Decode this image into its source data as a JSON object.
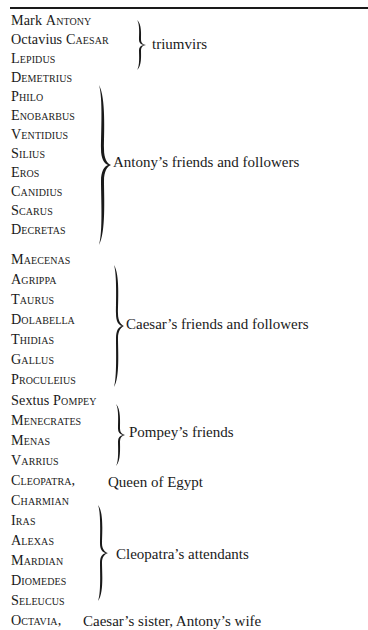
{
  "characters": [
    {
      "prefix": "Mark ",
      "name": "Antony",
      "suffix": ""
    },
    {
      "prefix": "Octavius ",
      "name": "Caesar",
      "suffix": ""
    },
    {
      "prefix": "",
      "name": "Lepidus",
      "suffix": ""
    },
    {
      "prefix": "",
      "name": "Demetrius",
      "suffix": ""
    },
    {
      "prefix": "",
      "name": "Philo",
      "suffix": ""
    },
    {
      "prefix": "",
      "name": "Enobarbus",
      "suffix": ""
    },
    {
      "prefix": "",
      "name": "Ventidius",
      "suffix": ""
    },
    {
      "prefix": "",
      "name": "Silius",
      "suffix": ""
    },
    {
      "prefix": "",
      "name": "Eros",
      "suffix": ""
    },
    {
      "prefix": "",
      "name": "Canidius",
      "suffix": ""
    },
    {
      "prefix": "",
      "name": "Scarus",
      "suffix": ""
    },
    {
      "prefix": "",
      "name": "Decretas",
      "suffix": ""
    },
    {
      "prefix": "",
      "name": "Maecenas",
      "suffix": ""
    },
    {
      "prefix": "",
      "name": "Agrippa",
      "suffix": ""
    },
    {
      "prefix": "",
      "name": "Taurus",
      "suffix": ""
    },
    {
      "prefix": "",
      "name": "Dolabella",
      "suffix": ""
    },
    {
      "prefix": "",
      "name": "Thidias",
      "suffix": ""
    },
    {
      "prefix": "",
      "name": "Gallus",
      "suffix": ""
    },
    {
      "prefix": "",
      "name": "Proculeius",
      "suffix": ""
    },
    {
      "prefix": "Sextus ",
      "name": "Pompey",
      "suffix": ""
    },
    {
      "prefix": "",
      "name": "Menecrates",
      "suffix": ""
    },
    {
      "prefix": "",
      "name": "Menas",
      "suffix": ""
    },
    {
      "prefix": "",
      "name": "Varrius",
      "suffix": ""
    },
    {
      "prefix": "",
      "name": "Cleopatra",
      "suffix": ","
    },
    {
      "prefix": "",
      "name": "Charmian",
      "suffix": ""
    },
    {
      "prefix": "",
      "name": "Iras",
      "suffix": ""
    },
    {
      "prefix": "",
      "name": "Alexas",
      "suffix": ""
    },
    {
      "prefix": "",
      "name": "Mardian",
      "suffix": ""
    },
    {
      "prefix": "",
      "name": "Diomedes",
      "suffix": ""
    },
    {
      "prefix": "",
      "name": "Seleucus",
      "suffix": ""
    },
    {
      "prefix": "",
      "name": "Octavia",
      "suffix": ","
    }
  ],
  "groups": [
    {
      "label": "triumvirs",
      "first_row": 0,
      "last_row": 2
    },
    {
      "label": "Antony’s friends and followers",
      "first_row": 3,
      "last_row": 11
    },
    {
      "label": "Caesar’s friends and followers",
      "first_row": 12,
      "last_row": 18
    },
    {
      "label": "Pompey’s friends",
      "first_row": 19,
      "last_row": 22
    },
    {
      "label": "Cleopatra’s attendants",
      "first_row": 24,
      "last_row": 29
    }
  ],
  "descriptions": [
    {
      "row": 23,
      "text": "Queen of Egypt"
    },
    {
      "row": 30,
      "text": "Caesar’s sister, Antony’s wife"
    }
  ]
}
